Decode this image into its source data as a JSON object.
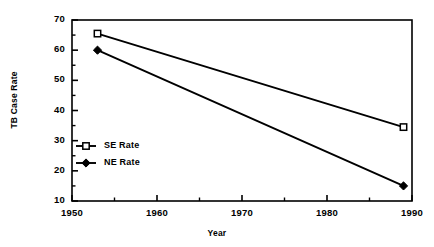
{
  "chart_data": {
    "type": "line",
    "title": "TB Case Rates",
    "title_clipped": true,
    "xlabel": "Year",
    "ylabel": "TB Case Rate",
    "xlim": [
      1950,
      1990
    ],
    "ylim": [
      10,
      70
    ],
    "xticks": [
      "1950",
      "1960",
      "1970",
      "1980",
      "1990"
    ],
    "xtick_values": [
      1950,
      1960,
      1970,
      1980,
      1990
    ],
    "xminor_values": [
      1955,
      1965,
      1975,
      1985
    ],
    "yticks": [
      "10",
      "20",
      "30",
      "40",
      "50",
      "60",
      "70"
    ],
    "ytick_values": [
      10,
      20,
      30,
      40,
      50,
      60,
      70
    ],
    "yminor_values": [
      15,
      25,
      35,
      45,
      55,
      65
    ],
    "grid": false,
    "legend_position": "center-left",
    "x": [
      1953,
      1989
    ],
    "series": [
      {
        "name": "SE Rate",
        "marker": "open-square",
        "color": "#000000",
        "values": [
          65.5,
          34.5
        ]
      },
      {
        "name": "NE Rate",
        "marker": "filled-diamond",
        "color": "#000000",
        "values": [
          60.0,
          15.0
        ]
      }
    ]
  },
  "legend": {
    "entries": [
      {
        "label": "SE Rate"
      },
      {
        "label": "NE Rate"
      }
    ]
  },
  "colors": {
    "axis": "#000000",
    "line": "#000000",
    "background": "#ffffff"
  }
}
